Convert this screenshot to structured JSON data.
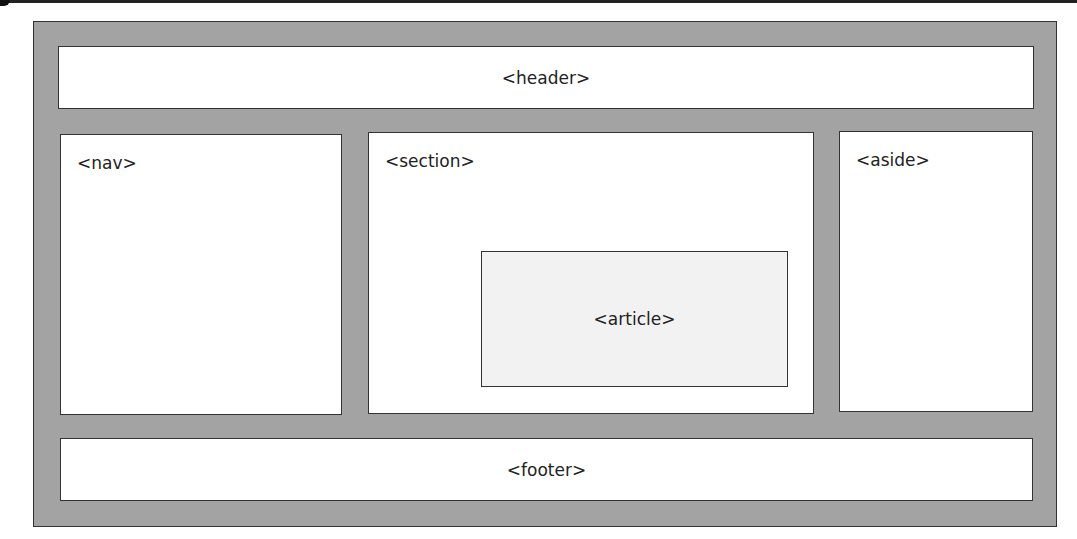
{
  "diagram": {
    "colors": {
      "background": "#ffffff",
      "container_fill": "#a3a3a3",
      "box_fill": "#ffffff",
      "article_fill": "#f2f2f2",
      "border": "#333333"
    },
    "blocks": {
      "header": "<header>",
      "nav": "<nav>",
      "section": "<section>",
      "article": "<article>",
      "aside": "<aside>",
      "footer": "<footer>"
    }
  }
}
